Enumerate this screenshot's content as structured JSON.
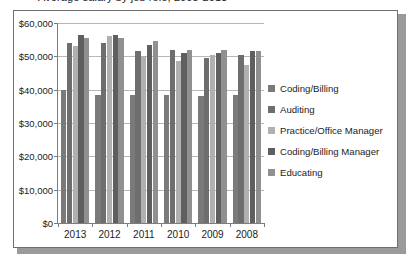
{
  "title_strip": {
    "text": "Average salary by job role, 2008-2013"
  },
  "legend": {
    "position": "right",
    "items": [
      {
        "label": "Coding/Billing",
        "color": "#7a7a7a"
      },
      {
        "label": "Auditing",
        "color": "#6e6e6e"
      },
      {
        "label": "Practice/Office Manager",
        "color": "#b0b0b0"
      },
      {
        "label": "Coding/Billing Manager",
        "color": "#5f5f5f"
      },
      {
        "label": "Educating",
        "color": "#909090"
      }
    ]
  },
  "axis": {
    "y_ticks": [
      "$0",
      "$10,000",
      "$20,000",
      "$30,000",
      "$40,000",
      "$50,000",
      "$60,000"
    ],
    "x_ticks": [
      "2013",
      "2012",
      "2011",
      "2010",
      "2009",
      "2008"
    ]
  },
  "chart_data": {
    "type": "bar",
    "title": "Average salary by job role, 2008-2013",
    "xlabel": "",
    "ylabel": "",
    "ylim": [
      0,
      60000
    ],
    "ytick_values": [
      0,
      10000,
      20000,
      30000,
      40000,
      50000,
      60000
    ],
    "ytick_labels": [
      "$0",
      "$10,000",
      "$20,000",
      "$30,000",
      "$40,000",
      "$50,000",
      "$60,000"
    ],
    "grid": true,
    "legend_position": "right",
    "categories": [
      "2013",
      "2012",
      "2011",
      "2010",
      "2009",
      "2008"
    ],
    "series": [
      {
        "name": "Coding/Billing",
        "color": "#7a7a7a",
        "values": [
          40000,
          38500,
          38500,
          38500,
          38000,
          38500
        ]
      },
      {
        "name": "Auditing",
        "color": "#6e6e6e",
        "values": [
          54000,
          54000,
          51500,
          52000,
          49500,
          50500
        ]
      },
      {
        "name": "Practice/Office Manager",
        "color": "#b0b0b0",
        "values": [
          53000,
          56000,
          50000,
          48500,
          50500,
          47500
        ]
      },
      {
        "name": "Coding/Billing Manager",
        "color": "#5f5f5f",
        "values": [
          56500,
          56500,
          53500,
          51000,
          51000,
          51500
        ]
      },
      {
        "name": "Educating",
        "color": "#909090",
        "values": [
          55500,
          55500,
          54500,
          52000,
          52000,
          51500
        ]
      }
    ]
  }
}
